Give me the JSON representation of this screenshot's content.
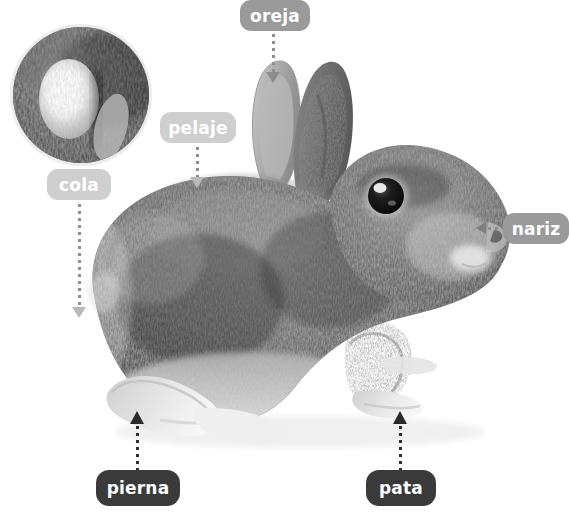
{
  "diagram": {
    "language": "es",
    "background_color": "#ffffff",
    "image_type": "black-and-white photograph"
  },
  "inset": {
    "name": "tail-closeup",
    "caption_label": "cola",
    "border_color": "#ececec"
  },
  "labels": [
    {
      "id": "oreja",
      "text": "oreja",
      "tone": "mid",
      "color": "#9a9a9a",
      "text_color": "#ffffff",
      "x": 240,
      "y": 0,
      "w": 70,
      "h": 31,
      "points_to": "ear",
      "connector": "dotted-vertical-down",
      "arrow": "down"
    },
    {
      "id": "pelaje",
      "text": "pelaje",
      "tone": "light",
      "color": "#cfcfcf",
      "text_color": "#ffffff",
      "x": 160,
      "y": 112,
      "w": 76,
      "h": 31,
      "points_to": "fur",
      "connector": "dotted-vertical-down",
      "arrow": "down"
    },
    {
      "id": "cola",
      "text": "cola",
      "tone": "light",
      "color": "#cfcfcf",
      "text_color": "#ffffff",
      "x": 47,
      "y": 169,
      "w": 64,
      "h": 31,
      "points_to": "tail",
      "connector": "dotted-vertical-down",
      "arrow": "down"
    },
    {
      "id": "nariz",
      "text": "nariz",
      "tone": "mid",
      "color": "#9a9a9a",
      "text_color": "#ffffff",
      "x": 503,
      "y": 213,
      "w": 66,
      "h": 31,
      "points_to": "nose",
      "connector": "dotted-horizontal-left",
      "arrow": "left"
    },
    {
      "id": "pierna",
      "text": "pierna",
      "tone": "dark",
      "color": "#3a3a3a",
      "text_color": "#ffffff",
      "x": 96,
      "y": 470,
      "w": 84,
      "h": 36,
      "points_to": "leg",
      "connector": "dotted-vertical-up",
      "arrow": "up"
    },
    {
      "id": "pata",
      "text": "pata",
      "tone": "dark",
      "color": "#3a3a3a",
      "text_color": "#ffffff",
      "x": 366,
      "y": 470,
      "w": 70,
      "h": 36,
      "points_to": "paw",
      "connector": "dotted-vertical-up",
      "arrow": "up"
    }
  ]
}
